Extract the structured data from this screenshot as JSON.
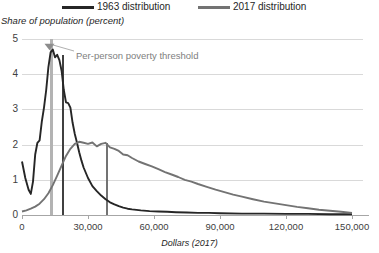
{
  "legend": {
    "items": [
      {
        "label": "1963 distribution",
        "color": "#262626",
        "name": "legend-1963"
      },
      {
        "label": "2017 distribution",
        "color": "#737373",
        "name": "legend-2017"
      }
    ]
  },
  "annotations": [
    {
      "text": "Per-person poverty threshold",
      "color": "#808080"
    }
  ],
  "chart_data": {
    "type": "line",
    "title": "",
    "subtitle": "",
    "xlabel": "Dollars (2017)",
    "ylabel": "Share of population (percent)",
    "xlim": [
      0,
      155000
    ],
    "ylim": [
      0,
      5
    ],
    "grid": true,
    "legend_position": "top",
    "xticks": [
      0,
      30000,
      60000,
      90000,
      120000,
      150000
    ],
    "xticklabels": [
      "0",
      "30,000",
      "60,000",
      "90,000",
      "120,000",
      "150,000"
    ],
    "yticks": [
      0,
      1,
      2,
      3,
      4,
      5
    ],
    "yticklabels": [
      "0",
      "1",
      "2",
      "3",
      "4",
      "5"
    ],
    "markers": [
      {
        "name": "poverty-threshold-band",
        "x": 12500,
        "y_top": 5.0,
        "y_bottom": 0,
        "color": "#b3b3b3",
        "label": "Per-person poverty threshold"
      },
      {
        "name": "median-1963-line",
        "x": 18000,
        "y_top": 4.55,
        "y_bottom": 0,
        "color": "#404040"
      },
      {
        "name": "median-2017-line",
        "x": 38000,
        "y_top": 2.05,
        "y_bottom": 0,
        "color": "#737373"
      }
    ],
    "series": [
      {
        "name": "1963 distribution",
        "color": "#262626",
        "x": [
          0,
          1500,
          3000,
          4000,
          5000,
          6000,
          7000,
          8000,
          9000,
          10000,
          11000,
          12000,
          13000,
          14000,
          15000,
          16000,
          17000,
          18000,
          19000,
          20000,
          21000,
          22000,
          23000,
          24000,
          25000,
          26000,
          27000,
          28000,
          30000,
          32000,
          34000,
          36000,
          38000,
          40000,
          42000,
          44000,
          46000,
          48000,
          50000,
          54000,
          58000,
          62000,
          66000,
          70000,
          75000,
          80000,
          85000,
          90000,
          100000,
          110000,
          120000,
          130000,
          140000,
          150000
        ],
        "values": [
          1.52,
          1.05,
          0.72,
          0.6,
          0.95,
          1.72,
          2.05,
          2.12,
          2.65,
          3.05,
          3.55,
          4.2,
          4.62,
          4.7,
          4.48,
          4.55,
          4.4,
          4.1,
          3.55,
          3.2,
          3.18,
          3.05,
          2.62,
          2.3,
          2.05,
          1.78,
          1.55,
          1.35,
          1.05,
          0.82,
          0.68,
          0.55,
          0.45,
          0.36,
          0.3,
          0.25,
          0.21,
          0.18,
          0.16,
          0.13,
          0.11,
          0.1,
          0.09,
          0.08,
          0.07,
          0.06,
          0.06,
          0.05,
          0.04,
          0.04,
          0.03,
          0.03,
          0.02,
          0.02
        ]
      },
      {
        "name": "2017 distribution",
        "color": "#737373",
        "x": [
          0,
          2000,
          4000,
          6000,
          8000,
          10000,
          12000,
          14000,
          16000,
          18000,
          20000,
          22000,
          24000,
          26000,
          28000,
          30000,
          32000,
          34000,
          36000,
          38000,
          40000,
          42000,
          44000,
          46000,
          48000,
          50000,
          53000,
          56000,
          59000,
          62000,
          65000,
          68000,
          71000,
          74000,
          77000,
          80000,
          84000,
          88000,
          92000,
          96000,
          100000,
          105000,
          110000,
          115000,
          120000,
          125000,
          130000,
          135000,
          140000,
          145000,
          150000
        ],
        "values": [
          0.1,
          0.13,
          0.18,
          0.24,
          0.32,
          0.45,
          0.62,
          0.85,
          1.12,
          1.4,
          1.68,
          1.88,
          2.02,
          2.08,
          2.05,
          2.02,
          2.06,
          1.95,
          2.02,
          2.05,
          1.92,
          1.88,
          1.82,
          1.72,
          1.7,
          1.62,
          1.52,
          1.45,
          1.38,
          1.3,
          1.22,
          1.15,
          1.08,
          1.0,
          0.95,
          0.88,
          0.8,
          0.72,
          0.65,
          0.58,
          0.52,
          0.45,
          0.38,
          0.33,
          0.28,
          0.23,
          0.19,
          0.15,
          0.12,
          0.09,
          0.06
        ]
      }
    ]
  }
}
